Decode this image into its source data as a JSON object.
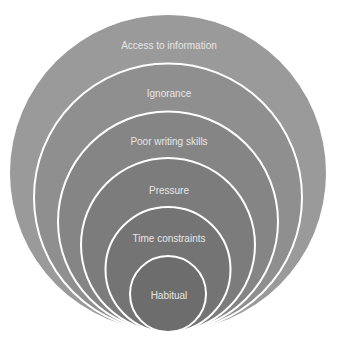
{
  "diagram": {
    "type": "nested-circles",
    "layers": [
      {
        "label": "Access to information",
        "fill": "#9a9a9a"
      },
      {
        "label": "Ignorance",
        "fill": "#8f8f8f"
      },
      {
        "label": "Poor writing skills",
        "fill": "#858585"
      },
      {
        "label": "Pressure",
        "fill": "#7c7c7c"
      },
      {
        "label": "Time constraints",
        "fill": "#747474"
      },
      {
        "label": "Habitual",
        "fill": "#6d6d6d"
      }
    ],
    "border_color": "#ffffff"
  }
}
